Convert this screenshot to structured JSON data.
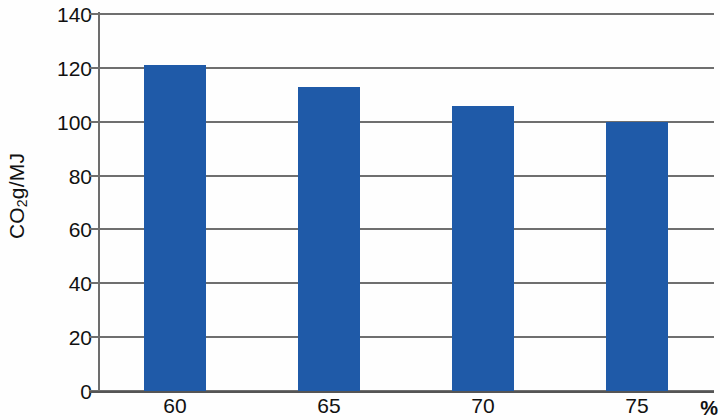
{
  "chart_data": {
    "type": "bar",
    "title": "",
    "subtitle": "",
    "xlabel": "%",
    "ylabel": "CO2g/MJ",
    "ylabel_parts": {
      "prefix": "CO",
      "subscript": "2",
      "suffix": "g/MJ"
    },
    "categories": [
      "60",
      "65",
      "70",
      "75"
    ],
    "values": [
      121,
      113,
      106,
      100
    ],
    "series": [
      {
        "name": "CO2 intensity",
        "values": [
          121,
          113,
          106,
          100
        ],
        "color": "#1F5AA8"
      }
    ],
    "ylim": [
      0,
      140
    ],
    "yticks": [
      0,
      20,
      40,
      60,
      80,
      100,
      120,
      140
    ],
    "ytick_labels": [
      "0",
      "20",
      "40",
      "60",
      "80",
      "100",
      "120",
      "140"
    ],
    "xtick_labels": [
      "60",
      "65",
      "70",
      "75"
    ],
    "grid": "horizontal",
    "legend": "none",
    "bar_color": "#1F5AA8",
    "grid_color": "#6F6F6F",
    "axis_color": "#555555",
    "background": "#FEFEFE",
    "annotations": []
  }
}
